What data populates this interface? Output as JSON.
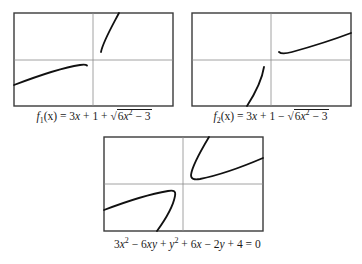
{
  "figure": {
    "panels": [
      {
        "id": "f1",
        "caption": {
          "func_name": "f",
          "subscript": "1",
          "arg": "(x)",
          "lhs_eq": " = 3",
          "x1": "x",
          "plus_one": " + 1 + ",
          "sqrt_symbol": "√",
          "radicand_coef": "6",
          "radicand_var": "x",
          "radicand_exp": "2",
          "radicand_rest": " − 3"
        },
        "curves": [
          "upper branch rising steeply from near origin to top",
          "lower branch increasing from left edge toward origin"
        ]
      },
      {
        "id": "f2",
        "caption": {
          "func_name": "f",
          "subscript": "2",
          "arg": "(x)",
          "lhs_eq": " = 3",
          "x1": "x",
          "plus_one": " + 1 − ",
          "sqrt_symbol": "√",
          "radicand_coef": "6",
          "radicand_var": "x",
          "radicand_exp": "2",
          "radicand_rest": " − 3"
        },
        "curves": [
          "upper branch increasing from near origin to right edge",
          "lower branch rising steeply from bottom toward origin"
        ]
      },
      {
        "id": "implicit",
        "caption": {
          "text_a": "3",
          "x": "x",
          "exp2": "2",
          "text_b": " − 6",
          "xy": "xy",
          "text_c": " + ",
          "y": "y",
          "exp2b": "2",
          "text_d": " + 6",
          "x2": "x",
          "text_e": " − 2",
          "y2": "y",
          "text_f": " + 4 = 0"
        },
        "curves": [
          "upper hyperbola branch",
          "lower hyperbola branch"
        ]
      }
    ],
    "colors": {
      "frame": "#3a3a3a",
      "axis": "#8a8a8a",
      "curve": "#111111",
      "background": "#ffffff"
    }
  }
}
